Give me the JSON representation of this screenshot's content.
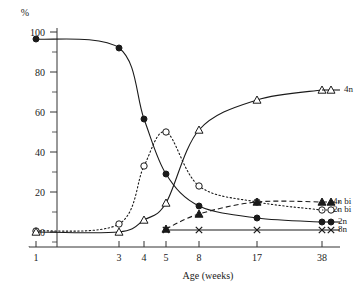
{
  "chart_data": {
    "type": "line",
    "title": "",
    "xlabel": "Age (weeks)",
    "ylabel": "%",
    "x": [
      1,
      3,
      4,
      5,
      8,
      17,
      38
    ],
    "xtick_labels": [
      "1",
      "3",
      "4",
      "5",
      "8",
      "17",
      "38"
    ],
    "ylim": [
      0,
      100
    ],
    "ytick_labels": [
      "0",
      "20",
      "40",
      "60",
      "80",
      "100"
    ],
    "yticks": [
      0,
      20,
      40,
      60,
      80,
      100
    ],
    "yticks_minor": [
      10,
      30,
      50,
      70,
      90
    ],
    "grid": false,
    "legend_position": "right-inline",
    "series": [
      {
        "name": "2n",
        "label": "2n",
        "marker": "filled-circle",
        "linestyle": "solid",
        "color": "#1a1a1a",
        "values": [
          96.5,
          92,
          56.5,
          29,
          13,
          7,
          5
        ]
      },
      {
        "name": "2n bi",
        "label": "2n bi",
        "marker": "open-circle",
        "linestyle": "dotted",
        "color": "#1a1a1a",
        "values": [
          0.5,
          4,
          33,
          50,
          23,
          15,
          11
        ]
      },
      {
        "name": "4n",
        "label": "4n",
        "marker": "open-triangle",
        "linestyle": "solid",
        "color": "#1a1a1a",
        "values": [
          0,
          0,
          6,
          14.5,
          51,
          66,
          71
        ]
      },
      {
        "name": "4n bi",
        "label": "4n bi",
        "marker": "filled-triangle",
        "linestyle": "dashed",
        "color": "#1a1a1a",
        "values": [
          null,
          null,
          null,
          1.5,
          9,
          15,
          15
        ]
      },
      {
        "name": "8n",
        "label": "8n",
        "marker": "cross",
        "linestyle": "solid",
        "color": "#1a1a1a",
        "values": [
          null,
          null,
          null,
          1,
          1,
          1,
          1
        ]
      }
    ],
    "legend_entries": [
      {
        "label": "4n",
        "marker": "open-triangle",
        "linestyle": "solid"
      },
      {
        "label": "4n bi",
        "marker": "filled-triangle",
        "linestyle": "dashed"
      },
      {
        "label": "2n bi",
        "marker": "open-circle",
        "linestyle": "dotted"
      },
      {
        "label": "2n",
        "marker": "filled-circle",
        "linestyle": "solid"
      },
      {
        "label": "8n",
        "marker": "cross",
        "linestyle": "solid"
      }
    ]
  }
}
